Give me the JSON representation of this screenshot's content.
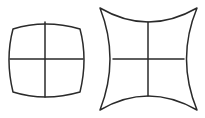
{
  "diagram": {
    "title": "",
    "background": "#ffffff",
    "stroke_color": "#2a2a2a",
    "stroke_width": 1.5,
    "figures": [
      {
        "name": "barrel-distortion-grid",
        "label": "",
        "shape": "barrel",
        "outline": "M13,29 Q45,19 80,29 Q88,59 80,92 Q45,102 13,92 Q5,59 13,29 Z",
        "cross_vertical": {
          "x1": 45,
          "y1": 22,
          "x2": 45,
          "y2": 97
        },
        "cross_horizontal": {
          "x1": 10,
          "y1": 59,
          "x2": 83,
          "y2": 59
        }
      },
      {
        "name": "pincushion-distortion-grid",
        "label": "",
        "shape": "pincushion",
        "outline": "M100,8 Q148,36 197,8 Q176,59 197,110 Q148,82 100,110 Q120,59 100,8 Z",
        "cross_vertical": {
          "x1": 148,
          "y1": 22,
          "x2": 148,
          "y2": 96
        },
        "cross_horizontal": {
          "x1": 113,
          "y1": 59,
          "x2": 184,
          "y2": 59
        }
      }
    ]
  }
}
